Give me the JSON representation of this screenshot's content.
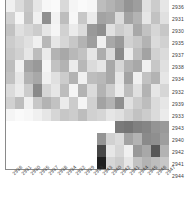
{
  "chart_data": {
    "type": "heatmap",
    "title": "",
    "xlabel": "",
    "ylabel": "",
    "grid": false,
    "legend": "none",
    "colormap": "greys",
    "colormap_low": "#ffffff",
    "colormap_high": "#000000",
    "vmin": 0,
    "vmax": 1,
    "n_rows": 14,
    "n_cols": 18,
    "row_labels": [
      "2936",
      "2931",
      "2930",
      "2935",
      "2937",
      "2938",
      "2934",
      "2932",
      "2939",
      "2933",
      "2943",
      "2940",
      "2942",
      "2941",
      "2944"
    ],
    "col_labels": [
      "2936",
      "2931",
      "2930",
      "2935",
      "2937",
      "2938",
      "2934",
      "2932",
      "2939",
      "2933",
      "2943",
      "2940",
      "2942",
      "2941",
      "2944",
      "2945",
      "2946",
      "2947"
    ],
    "values": [
      [
        0.06,
        0.14,
        0.22,
        0.1,
        0.03,
        0.02,
        0.15,
        0.04,
        0.02,
        0.03,
        0.26,
        0.3,
        0.34,
        0.42,
        0.38,
        0.12,
        0.2,
        0.1
      ],
      [
        0.18,
        0.04,
        0.24,
        0.06,
        0.44,
        0.05,
        0.26,
        0.03,
        0.22,
        0.08,
        0.36,
        0.34,
        0.14,
        0.36,
        0.3,
        0.1,
        0.24,
        0.12
      ],
      [
        0.24,
        0.12,
        0.16,
        0.2,
        0.1,
        0.04,
        0.18,
        0.08,
        0.14,
        0.4,
        0.44,
        0.12,
        0.2,
        0.16,
        0.34,
        0.24,
        0.16,
        0.22
      ],
      [
        0.2,
        0.16,
        0.12,
        0.06,
        0.28,
        0.1,
        0.16,
        0.22,
        0.3,
        0.38,
        0.06,
        0.34,
        0.4,
        0.18,
        0.22,
        0.3,
        0.14,
        0.18
      ],
      [
        0.22,
        0.18,
        0.1,
        0.26,
        0.08,
        0.3,
        0.34,
        0.28,
        0.24,
        0.1,
        0.32,
        0.14,
        0.46,
        0.08,
        0.26,
        0.36,
        0.18,
        0.14
      ],
      [
        0.26,
        0.06,
        0.36,
        0.4,
        0.04,
        0.24,
        0.3,
        0.08,
        0.28,
        0.14,
        0.1,
        0.34,
        0.16,
        0.3,
        0.34,
        0.06,
        0.22,
        0.12
      ],
      [
        0.24,
        0.1,
        0.3,
        0.34,
        0.06,
        0.12,
        0.2,
        0.3,
        0.06,
        0.26,
        0.28,
        0.34,
        0.1,
        0.36,
        0.06,
        0.24,
        0.3,
        0.1
      ],
      [
        0.14,
        0.08,
        0.2,
        0.46,
        0.16,
        0.1,
        0.26,
        0.04,
        0.3,
        0.14,
        0.3,
        0.2,
        0.08,
        0.26,
        0.12,
        0.3,
        0.1,
        0.16
      ],
      [
        0.18,
        0.26,
        0.06,
        0.22,
        0.3,
        0.24,
        0.08,
        0.2,
        0.04,
        0.18,
        0.36,
        0.3,
        0.44,
        0.12,
        0.2,
        0.26,
        0.14,
        0.1
      ],
      [
        0.04,
        0.02,
        0.03,
        0.06,
        0.1,
        0.16,
        0.22,
        0.2,
        0.26,
        0.18,
        0.16,
        0.1,
        0.12,
        0.18,
        0.24,
        0.2,
        0.14,
        0.08
      ],
      [
        0.0,
        0.0,
        0.0,
        0.0,
        0.0,
        0.0,
        0.0,
        0.0,
        0.0,
        0.0,
        0.0,
        0.0,
        0.52,
        0.54,
        0.5,
        0.48,
        0.42,
        0.4
      ],
      [
        0.0,
        0.0,
        0.0,
        0.0,
        0.0,
        0.0,
        0.0,
        0.0,
        0.0,
        0.0,
        0.42,
        0.18,
        0.14,
        0.36,
        0.3,
        0.46,
        0.44,
        0.38
      ],
      [
        0.0,
        0.0,
        0.0,
        0.0,
        0.0,
        0.0,
        0.0,
        0.0,
        0.0,
        0.0,
        0.72,
        0.1,
        0.16,
        0.06,
        0.4,
        0.34,
        0.66,
        0.3
      ],
      [
        0.0,
        0.0,
        0.0,
        0.0,
        0.0,
        0.0,
        0.0,
        0.0,
        0.0,
        0.0,
        0.88,
        0.16,
        0.2,
        0.1,
        0.24,
        0.3,
        0.26,
        0.22
      ]
    ]
  }
}
